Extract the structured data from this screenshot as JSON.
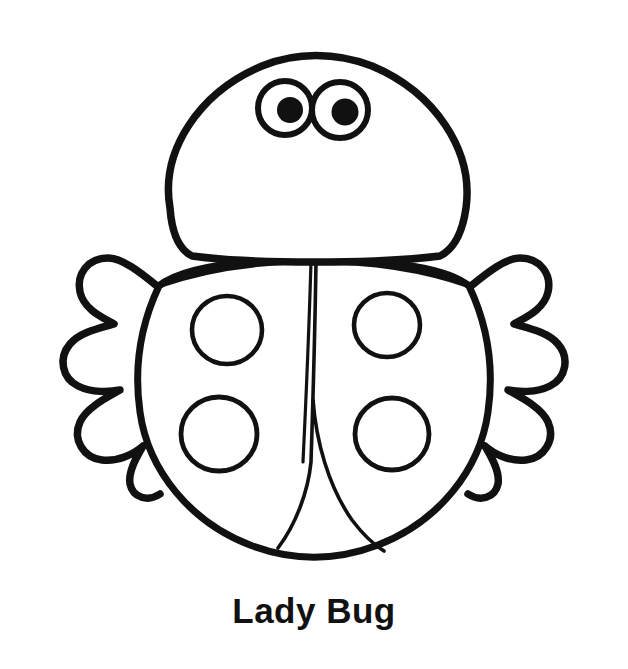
{
  "page": {
    "background_color": "#ffffff",
    "ink_color": "#111111",
    "width": 628,
    "height": 669
  },
  "caption": {
    "text": "Lady Bug"
  },
  "illustration": {
    "subject": "ladybug",
    "style": "black and white line art coloring page",
    "stroke_color": "#111111",
    "fill_color": "#ffffff",
    "outline_stroke_width": 7,
    "detail_stroke_width": 4,
    "parts": [
      {
        "name": "head",
        "label": "Head"
      },
      {
        "name": "left-eye",
        "label": "Left Eye"
      },
      {
        "name": "right-eye",
        "label": "Right Eye"
      },
      {
        "name": "left-pupil",
        "label": "Left Pupil"
      },
      {
        "name": "right-pupil",
        "label": "Right Pupil"
      },
      {
        "name": "body",
        "label": "Body"
      },
      {
        "name": "wing-divider",
        "label": "Wing Divider"
      },
      {
        "name": "left-legs",
        "label": "Left Legs"
      },
      {
        "name": "right-legs",
        "label": "Right Legs"
      },
      {
        "name": "spot-top-left",
        "label": "Top Left Spot"
      },
      {
        "name": "spot-top-right",
        "label": "Top Right Spot"
      },
      {
        "name": "spot-bottom-left",
        "label": "Bottom Left Spot"
      },
      {
        "name": "spot-bottom-right",
        "label": "Bottom Right Spot"
      }
    ],
    "spot_count": 4,
    "eye_count": 2,
    "leg_lobes_per_side": 3
  }
}
